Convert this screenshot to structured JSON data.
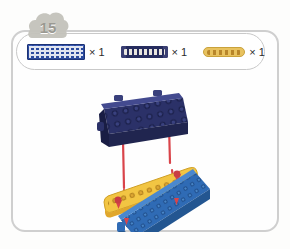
{
  "card": {
    "step_number": "15",
    "badge_icon": "step-number-badge"
  },
  "parts_list": {
    "items": [
      {
        "icon": "blue-grid-plate-icon",
        "part_name": "blue grid plate",
        "color": "#2b4a9e",
        "quantity_label": "× 1"
      },
      {
        "icon": "dark-blue-beam-icon",
        "part_name": "dark blue beam",
        "color": "#262c5e",
        "quantity_label": "× 1"
      },
      {
        "icon": "yellow-beam-icon",
        "part_name": "yellow beam",
        "color": "#e8c25f",
        "quantity_label": "× 1"
      }
    ]
  },
  "assembly": {
    "title": "exploded assembly diagram",
    "pieces": [
      {
        "name": "dark-blue-beam",
        "color": "#2b3168",
        "position": "top"
      },
      {
        "name": "yellow-beam",
        "color": "#f2c543",
        "position": "middle"
      },
      {
        "name": "blue-grid-plate",
        "color": "#2f6bb5",
        "position": "bottom"
      }
    ],
    "connectors": {
      "name": "red-pin",
      "color": "#d9444a",
      "count": "4"
    }
  },
  "colors": {
    "frame_border": "#cfcfcf",
    "badge_fill": "#c3c2bb",
    "badge_text": "#9a9992",
    "background": "#fdfdfc"
  }
}
